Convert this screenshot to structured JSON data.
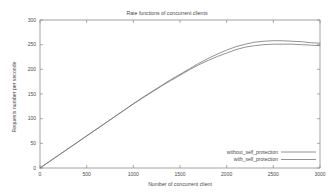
{
  "chart_data": {
    "type": "line",
    "title": "Rate functions of concurrent clients",
    "xlabel": "Number of concurrent client",
    "ylabel": "Requests number per seconde",
    "xlim": [
      0,
      3000
    ],
    "ylim": [
      0,
      300
    ],
    "xticks": [
      0,
      500,
      1000,
      1500,
      2000,
      2500,
      3000
    ],
    "yticks": [
      0,
      50,
      100,
      150,
      200,
      250,
      300
    ],
    "xtick_labels": [
      "0",
      "500",
      "1000",
      "1500",
      "2000",
      "2500",
      "3000"
    ],
    "ytick_labels": [
      "0",
      "50",
      "100",
      "150",
      "200",
      "250",
      "300"
    ],
    "grid": false,
    "legend_position": "bottom-right",
    "line_color": "#6f6f6f",
    "axis_color": "#8a8a8a",
    "background": "#ffffff",
    "series": [
      {
        "name": "without_self_protection",
        "x": [
          0,
          100,
          200,
          300,
          400,
          500,
          600,
          700,
          800,
          900,
          1000,
          1100,
          1200,
          1300,
          1400,
          1500,
          1600,
          1700,
          1800,
          1900,
          2000,
          2100,
          2200,
          2300,
          2400,
          2500,
          2600,
          2700,
          2800,
          2900,
          3000
        ],
        "values": [
          0,
          13,
          26,
          39,
          52,
          65,
          78,
          91,
          104,
          117,
          130,
          143,
          155,
          167,
          179,
          190,
          201,
          212,
          222,
          231,
          239,
          246,
          251,
          255,
          257,
          258,
          258,
          257,
          256,
          254,
          253
        ]
      },
      {
        "name": "with_self_protection",
        "x": [
          0,
          100,
          200,
          300,
          400,
          500,
          600,
          700,
          800,
          900,
          1000,
          1100,
          1200,
          1300,
          1400,
          1500,
          1600,
          1700,
          1800,
          1900,
          2000,
          2100,
          2200,
          2300,
          2400,
          2500,
          2600,
          2700,
          2800,
          2900,
          3000
        ],
        "values": [
          0,
          13,
          26,
          39,
          52,
          65,
          78,
          91,
          104,
          117,
          130,
          142,
          154,
          166,
          177,
          188,
          199,
          209,
          218,
          226,
          233,
          240,
          245,
          248,
          250,
          251,
          251,
          251,
          250,
          249,
          248
        ]
      }
    ]
  },
  "legend": {
    "entries": [
      {
        "label": "without_self_protection"
      },
      {
        "label": "with_self_protection"
      }
    ]
  }
}
